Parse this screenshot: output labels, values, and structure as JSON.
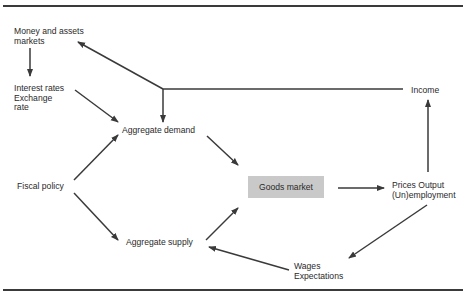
{
  "diagram": {
    "nodes": {
      "money_markets": "Money and assets\nmarkets",
      "interest_rates": "Interest rates\nExchange\nrate",
      "aggregate_demand": "Aggregate demand",
      "fiscal_policy": "Fiscal policy",
      "aggregate_supply": "Aggregate supply",
      "goods_market": "Goods market",
      "prices_output": "Prices Output\n(Un)employment",
      "income": "Income",
      "wages_expectations": "Wages\nExpectations"
    },
    "edges": [
      {
        "from": "Money and assets markets",
        "to": "Interest rates / Exchange rate"
      },
      {
        "from": "Interest rates / Exchange rate",
        "to": "Aggregate demand"
      },
      {
        "from": "Fiscal policy",
        "to": "Aggregate demand"
      },
      {
        "from": "Fiscal policy",
        "to": "Aggregate supply"
      },
      {
        "from": "Aggregate demand",
        "to": "Goods market"
      },
      {
        "from": "Aggregate supply",
        "to": "Goods market"
      },
      {
        "from": "Goods market",
        "to": "Prices Output (Un)employment"
      },
      {
        "from": "Prices Output (Un)employment",
        "to": "Income"
      },
      {
        "from": "Income",
        "to": "Money and assets markets"
      },
      {
        "from": "Income",
        "to": "Aggregate demand"
      },
      {
        "from": "Prices Output (Un)employment",
        "to": "Wages Expectations"
      },
      {
        "from": "Wages Expectations",
        "to": "Aggregate supply"
      }
    ],
    "colors": {
      "line": "#3a3a3a",
      "box_fill": "#c9c9c9",
      "text": "#2a2a2a"
    }
  }
}
